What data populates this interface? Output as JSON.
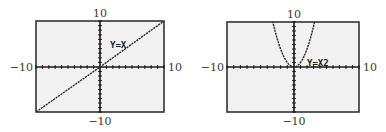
{
  "chart_data": [
    {
      "type": "line",
      "title": "",
      "function_label": "Y=X",
      "equation": "y = x",
      "xlabel": "",
      "ylabel": "",
      "xlim": [
        -10,
        10
      ],
      "ylim": [
        -10,
        10
      ],
      "x_tick_step": 1,
      "y_tick_step": 1,
      "tick_labels": {
        "left": "−10",
        "right": "10",
        "top": "10",
        "bottom": "−10"
      },
      "grid": false,
      "legend": "none",
      "series": [
        {
          "name": "Y=X",
          "x": [
            -10,
            -5,
            0,
            5,
            10
          ],
          "y": [
            -10,
            -5,
            0,
            5,
            10
          ]
        }
      ]
    },
    {
      "type": "line",
      "title": "",
      "function_label": "Y=X2",
      "equation": "y = x^2",
      "xlabel": "",
      "ylabel": "",
      "xlim": [
        -10,
        10
      ],
      "ylim": [
        -10,
        10
      ],
      "x_tick_step": 1,
      "y_tick_step": 1,
      "tick_labels": {
        "left": "−10",
        "right": "10",
        "top": "10",
        "bottom": "−10"
      },
      "grid": false,
      "legend": "none",
      "series": [
        {
          "name": "Y=X2",
          "x": [
            -3.16,
            -3,
            -2,
            -1,
            0,
            1,
            2,
            3,
            3.16
          ],
          "y": [
            10,
            9,
            4,
            1,
            0,
            1,
            4,
            9,
            10
          ]
        }
      ]
    }
  ],
  "colors": {
    "plot_background": "#f1f1f1",
    "frame": "#333333",
    "axes": "#1a1a1a",
    "curve": "#2a2a2a",
    "label_text": "#3a3a3a"
  }
}
